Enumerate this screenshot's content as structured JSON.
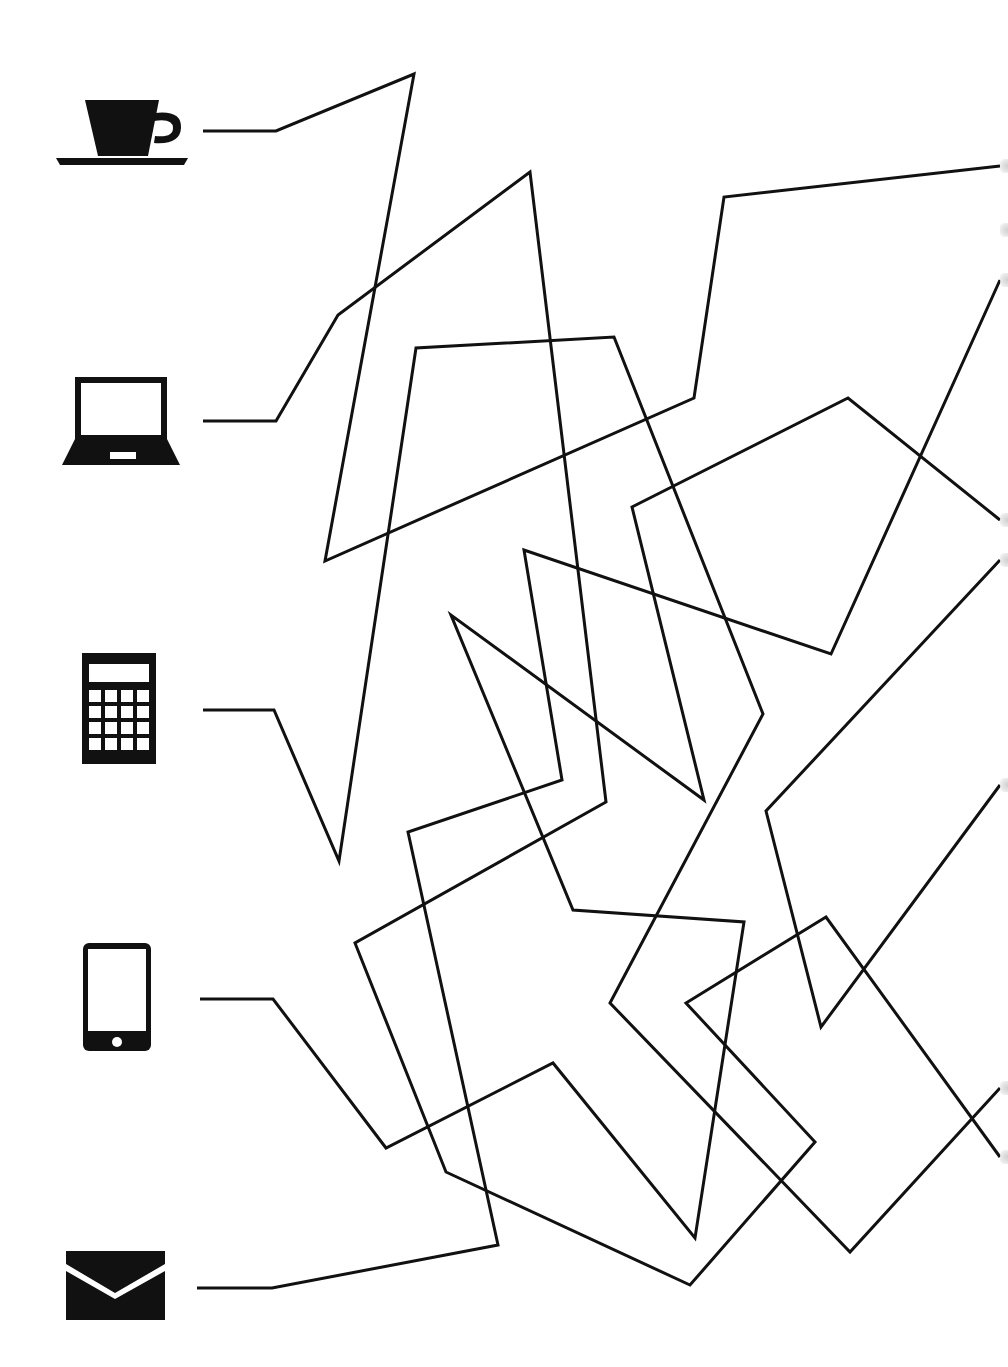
{
  "puzzle": {
    "title": "Connect the lines maze",
    "line_color": "#111111",
    "icon_color": "#111111",
    "stroke_width": 3
  },
  "icons": [
    {
      "id": "cup",
      "name": "coffee-cup-icon",
      "label": "Coffee cup",
      "anchor_y": 131
    },
    {
      "id": "laptop",
      "name": "laptop-icon",
      "label": "Laptop",
      "anchor_y": 421
    },
    {
      "id": "calculator",
      "name": "calculator-icon",
      "label": "Calculator",
      "anchor_y": 710
    },
    {
      "id": "phone",
      "name": "smartphone-icon",
      "label": "Smartphone",
      "anchor_y": 999
    },
    {
      "id": "mail",
      "name": "envelope-icon",
      "label": "Envelope",
      "anchor_y": 1288
    }
  ],
  "paths": [
    {
      "from": "cup",
      "points": "203,131 276,131 414,74 325,561 694,398 724,197 1000,166"
    },
    {
      "from": "laptop",
      "points": "203,421 276,421 338,315 530,172 606,802 355,943 446,1172 690,1285 815,1142 686,1003 826,917 1000,1157"
    },
    {
      "from": "calculator",
      "points": "203,710 274,710 339,861 416,348 614,337 763,714 610,1003 850,1252 1000,1088"
    },
    {
      "from": "phone",
      "points": "200,999 273,999 386,1148 553,1063 695,1238 744,922 573,910 451,615 704,800 632,507 848,398 1000,520"
    },
    {
      "from": "mail",
      "points": "197,1288 272,1288 498,1245 408,832 562,780 524,550 831,654 1000,280"
    },
    {
      "from": "right-edge",
      "points": "1000,560 766,811 821,1027 1000,785"
    }
  ],
  "right_edge_marks": [
    166,
    230,
    280,
    520,
    560,
    785,
    1088,
    1157
  ]
}
